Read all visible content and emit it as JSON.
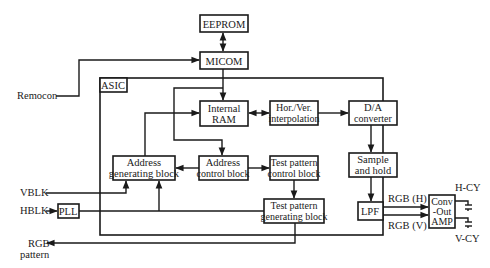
{
  "blocks": {
    "eeprom": "EEPROM",
    "micom": "MICOM",
    "asic": "ASIC",
    "internal_ram": [
      "Internal",
      "RAM"
    ],
    "interpolation": [
      "Hor./Ver.",
      "interpolation"
    ],
    "da_converter": [
      "D/A",
      "converter"
    ],
    "sample_hold": [
      "Sample",
      "and hold"
    ],
    "lpf": "LPF",
    "conv_amp": [
      "Conv",
      "-Out",
      "AMP"
    ],
    "address_gen": [
      "Address",
      "generating block"
    ],
    "address_ctrl": [
      "Address",
      "control block"
    ],
    "test_ctrl": [
      "Test pattern",
      "control block"
    ],
    "test_gen": [
      "Test pattern",
      "generating block"
    ],
    "pll": "PLL"
  },
  "signals": {
    "remocon": "Remocon",
    "vblk": "VBLK",
    "hblk": "HBLK",
    "rgb_pattern": [
      "RGB",
      "pattern"
    ],
    "rgb_h": "RGB (H)",
    "rgb_v": "RGB (V)",
    "h_cy": "H-CY",
    "v_cy": "V-CY"
  }
}
